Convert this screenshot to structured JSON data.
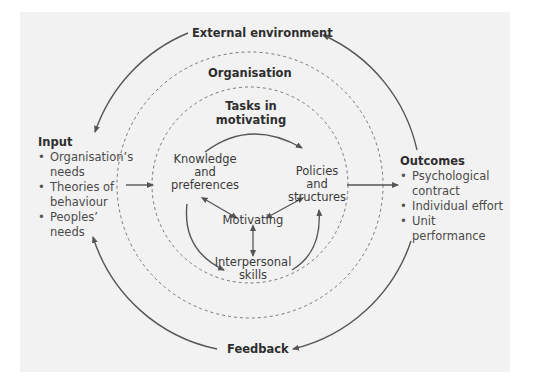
{
  "diagram": {
    "labels": {
      "external_environment": "External environment",
      "organisation": "Organisation",
      "tasks_in_motivating_line1": "Tasks in",
      "tasks_in_motivating_line2": "motivating",
      "knowledge_line1": "Knowledge",
      "knowledge_line2": "and",
      "knowledge_line3": "preferences",
      "policies_line1": "Policies",
      "policies_line2": "and",
      "policies_line3": "structures",
      "motivating": "Motivating",
      "interpersonal_line1": "Interpersonal",
      "interpersonal_line2": "skills",
      "feedback": "Feedback"
    },
    "input": {
      "title": "Input",
      "items": [
        {
          "line1": "Organisation’s",
          "line2": "needs"
        },
        {
          "line1": "Theories of",
          "line2": "behaviour"
        },
        {
          "line1": "Peoples’",
          "line2": "needs"
        }
      ]
    },
    "outcomes": {
      "title": "Outcomes",
      "items": [
        {
          "line1": "Psychological",
          "line2": "contract"
        },
        {
          "line1": "Individual effort",
          "line2": ""
        },
        {
          "line1": "Unit performance",
          "line2": ""
        }
      ]
    },
    "colors": {
      "panel": "#f2f2f2",
      "line": "#555555",
      "dash": "#777777",
      "text": "#3a3a3a"
    }
  }
}
